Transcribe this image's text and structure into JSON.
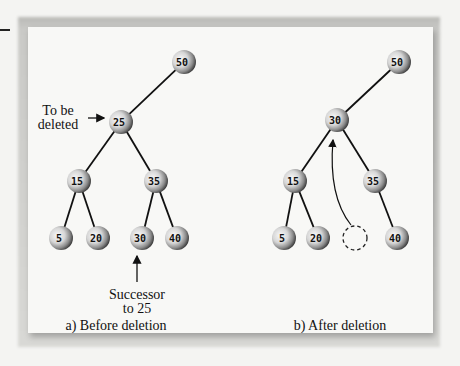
{
  "figure": {
    "panels": [
      {
        "id": "a",
        "caption": "a) Before deletion",
        "nodes": [
          {
            "key": "50",
            "label": "50",
            "cx": 184,
            "cy": 62
          },
          {
            "key": "25",
            "label": "25",
            "cx": 121,
            "cy": 122
          },
          {
            "key": "15",
            "label": "15",
            "cx": 79,
            "cy": 181
          },
          {
            "key": "35",
            "label": "35",
            "cx": 156,
            "cy": 181
          },
          {
            "key": "5",
            "label": "5",
            "cx": 61,
            "cy": 238
          },
          {
            "key": "20",
            "label": "20",
            "cx": 98,
            "cy": 238
          },
          {
            "key": "30",
            "label": "30",
            "cx": 142,
            "cy": 238
          },
          {
            "key": "40",
            "label": "40",
            "cx": 177,
            "cy": 238
          }
        ],
        "edges": [
          [
            "50",
            "25"
          ],
          [
            "25",
            "15"
          ],
          [
            "25",
            "35"
          ],
          [
            "15",
            "5"
          ],
          [
            "15",
            "20"
          ],
          [
            "35",
            "30"
          ],
          [
            "35",
            "40"
          ]
        ],
        "annotations": {
          "to_be_deleted_line1": "To be",
          "to_be_deleted_line2": "deleted",
          "successor_line1": "Successor",
          "successor_line2": "to 25"
        }
      },
      {
        "id": "b",
        "caption": "b) After deletion",
        "nodes": [
          {
            "key": "50",
            "label": "50",
            "cx": 399,
            "cy": 62
          },
          {
            "key": "30",
            "label": "30",
            "cx": 337,
            "cy": 120
          },
          {
            "key": "15",
            "label": "15",
            "cx": 295,
            "cy": 181
          },
          {
            "key": "35",
            "label": "35",
            "cx": 375,
            "cy": 181
          },
          {
            "key": "5",
            "label": "5",
            "cx": 284,
            "cy": 238
          },
          {
            "key": "20",
            "label": "20",
            "cx": 318,
            "cy": 238
          },
          {
            "key": "empty",
            "label": "",
            "cx": 355,
            "cy": 238,
            "dashed": true
          },
          {
            "key": "40",
            "label": "40",
            "cx": 397,
            "cy": 238
          }
        ],
        "edges": [
          [
            "50",
            "30"
          ],
          [
            "30",
            "15"
          ],
          [
            "30",
            "35"
          ],
          [
            "15",
            "5"
          ],
          [
            "15",
            "20"
          ],
          [
            "35",
            "40"
          ]
        ],
        "annotations": {
          "move_arrow": "successor moved from empty slot to replace deleted node"
        }
      }
    ]
  }
}
